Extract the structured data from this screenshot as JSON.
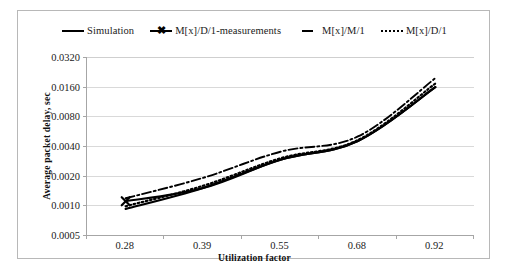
{
  "chart_data": {
    "type": "line",
    "title": "",
    "xlabel": "Utilization factor",
    "ylabel": "Average packet delay, sec",
    "x": [
      0.28,
      0.39,
      0.55,
      0.68,
      0.92
    ],
    "xtick_labels": [
      "0.28",
      "0.39",
      "0.55",
      "0.68",
      "0.92"
    ],
    "ytick_labels": [
      "0.0320",
      "0.0160",
      "0.0080",
      "0.0040",
      "0.0020",
      "0.0010",
      "0.0005"
    ],
    "ytick_values": [
      0.032,
      0.016,
      0.008,
      0.004,
      0.002,
      0.001,
      0.0005
    ],
    "yscale": "log",
    "ylim": [
      0.0005,
      0.032
    ],
    "grid": true,
    "legend_position": "top",
    "series": [
      {
        "name": "Simulation",
        "style": "solid",
        "values": [
          0.00092,
          0.0015,
          0.0029,
          0.0045,
          0.0158
        ]
      },
      {
        "name": "M[x]/D/1-measurements",
        "style": "solid-x-marker",
        "values": [
          0.0011,
          0.0015,
          0.0029,
          0.0045,
          0.0158
        ]
      },
      {
        "name": "M[x]/M/1",
        "style": "dash-dot",
        "values": [
          0.00118,
          0.0019,
          0.0035,
          0.005,
          0.0195
        ]
      },
      {
        "name": "M[x]/D/1",
        "style": "dotted",
        "values": [
          0.00098,
          0.00158,
          0.003,
          0.0046,
          0.0172
        ]
      }
    ]
  },
  "legend": {
    "items": [
      {
        "label": "Simulation",
        "swatch": "solid-line-swatch"
      },
      {
        "label": "M[x]/D/1-measurements",
        "swatch": "solid-line-x-marker-swatch"
      },
      {
        "label": "M[x]/M/1",
        "swatch": "dash-line-swatch"
      },
      {
        "label": "M[x]/D/1",
        "swatch": "dotted-line-swatch"
      }
    ]
  },
  "axes": {
    "y_title": "Average packet delay, sec",
    "x_title": "Utilization factor",
    "y_labels": [
      "0.0320",
      "0.0160",
      "0.0080",
      "0.0040",
      "0.0020",
      "0.0010",
      "0.0005"
    ],
    "x_labels": [
      "0.28",
      "0.39",
      "0.55",
      "0.68",
      "0.92"
    ]
  },
  "colors": {
    "series_line": "#000000",
    "gridline": "#d9d9d9",
    "axis": "#a6a6a6",
    "frame": "#b8b8b8",
    "text": "#1a1a1a",
    "background": "#ffffff"
  }
}
